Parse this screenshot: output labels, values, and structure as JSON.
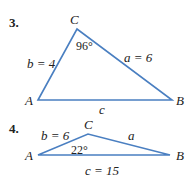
{
  "problems": [
    {
      "number": "3.",
      "vertices": {
        "A": "A",
        "B": "B",
        "C": "C"
      },
      "angle_C": "96°",
      "side_b": "b = 4",
      "side_a": "a = 6",
      "side_c": "c"
    },
    {
      "number": "4.",
      "vertices": {
        "A": "A",
        "B": "B",
        "C": "C"
      },
      "angle_C": "22°",
      "side_b": "b = 6",
      "side_a": "a",
      "side_c": "c = 15"
    }
  ],
  "colors": {
    "edge": "#4a7fc1",
    "text": "#222222"
  }
}
